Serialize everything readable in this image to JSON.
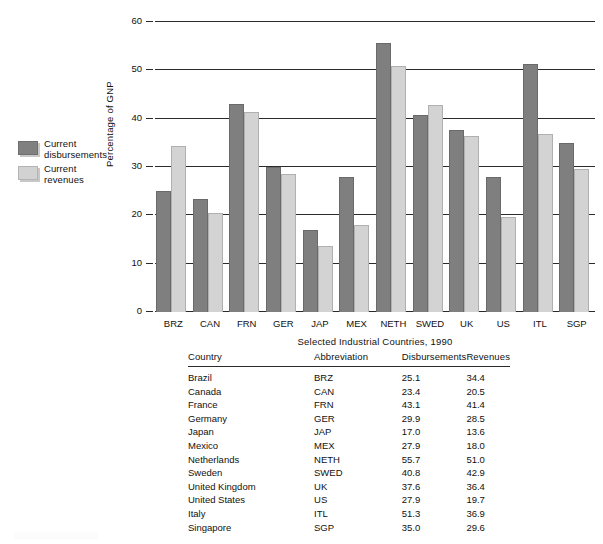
{
  "chart_data": {
    "type": "bar",
    "title": "",
    "subtitle": "",
    "xlabel": "Selected Industrial Countries, 1990",
    "ylabel": "Percentage of GNP",
    "categories": [
      "BRZ",
      "CAN",
      "FRN",
      "GER",
      "JAP",
      "MEX",
      "NETH",
      "SWED",
      "UK",
      "US",
      "ITL",
      "SGP"
    ],
    "series": [
      {
        "name": "Current disbursements",
        "color": "#7f7f7f",
        "values": [
          25.1,
          23.4,
          43.1,
          29.9,
          17.0,
          27.9,
          55.7,
          40.8,
          37.6,
          27.9,
          51.3,
          35.0
        ]
      },
      {
        "name": "Current revenues",
        "color": "#d3d3d3",
        "values": [
          34.4,
          20.5,
          41.4,
          28.5,
          13.6,
          18.0,
          51.0,
          42.9,
          36.4,
          19.7,
          36.9,
          29.6
        ]
      }
    ],
    "ylim": [
      0,
      60
    ],
    "yticks": [
      0,
      10,
      20,
      30,
      40,
      50,
      60
    ],
    "ytick_labels": [
      "0",
      "10",
      "20",
      "30",
      "40",
      "50",
      "60"
    ],
    "grid": true,
    "grid_axis": "y",
    "legend_position": "left-outside"
  },
  "legend": {
    "items": [
      {
        "label": "Current\ndisbursements",
        "swatch": "dark",
        "color": "#7f7f7f"
      },
      {
        "label": "Current\nrevenues",
        "swatch": "light",
        "color": "#d3d3d3"
      }
    ]
  },
  "table": {
    "columns": [
      "Country",
      "Abbreviation",
      "Disbursements",
      "Revenues"
    ],
    "rows": [
      {
        "country": "Brazil",
        "abbreviation": "BRZ",
        "disbursements": "25.1",
        "revenues": "34.4"
      },
      {
        "country": "Canada",
        "abbreviation": "CAN",
        "disbursements": "23.4",
        "revenues": "20.5"
      },
      {
        "country": "France",
        "abbreviation": "FRN",
        "disbursements": "43.1",
        "revenues": "41.4"
      },
      {
        "country": "Germany",
        "abbreviation": "GER",
        "disbursements": "29.9",
        "revenues": "28.5"
      },
      {
        "country": "Japan",
        "abbreviation": "JAP",
        "disbursements": "17.0",
        "revenues": "13.6"
      },
      {
        "country": "Mexico",
        "abbreviation": "MEX",
        "disbursements": "27.9",
        "revenues": "18.0"
      },
      {
        "country": "Netherlands",
        "abbreviation": "NETH",
        "disbursements": "55.7",
        "revenues": "51.0"
      },
      {
        "country": "Sweden",
        "abbreviation": "SWED",
        "disbursements": "40.8",
        "revenues": "42.9"
      },
      {
        "country": "United Kingdom",
        "abbreviation": "UK",
        "disbursements": "37.6",
        "revenues": "36.4"
      },
      {
        "country": "United States",
        "abbreviation": "US",
        "disbursements": "27.9",
        "revenues": "19.7"
      },
      {
        "country": "Italy",
        "abbreviation": "ITL",
        "disbursements": "51.3",
        "revenues": "36.9"
      },
      {
        "country": "Singapore",
        "abbreviation": "SGP",
        "disbursements": "35.0",
        "revenues": "29.6"
      }
    ]
  }
}
